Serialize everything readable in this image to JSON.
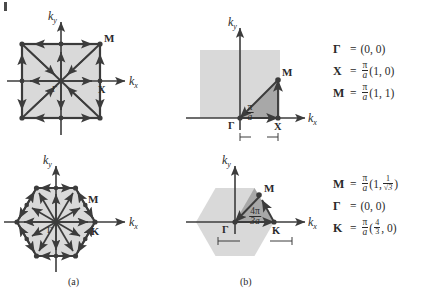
{
  "figure": {
    "panels": [
      {
        "id": "a",
        "label": "(a)"
      },
      {
        "id": "b",
        "label": "(b)"
      }
    ],
    "axis_labels": {
      "kx": "k",
      "kx_sub": "x",
      "ky": "k",
      "ky_sub": "y"
    },
    "colors": {
      "zone_fill": "#d9d9d9",
      "wedge_fill": "#a8a8a8",
      "line": "#3c3c3c",
      "background": "#ffffff",
      "text": "#2a2a2a"
    }
  },
  "square": {
    "points": {
      "gamma": "Γ",
      "x": "X",
      "m": "M"
    },
    "dimension": {
      "num": "π",
      "den": "a"
    },
    "equations": [
      {
        "symbol": "Γ",
        "eq": "=",
        "prefix": "",
        "num": "",
        "den": "",
        "value": "(0, 0)"
      },
      {
        "symbol": "X",
        "eq": "=",
        "num": "π",
        "den": "a",
        "value": "(1, 0)"
      },
      {
        "symbol": "M",
        "eq": "=",
        "num": "π",
        "den": "a",
        "value": "(1, 1)"
      }
    ]
  },
  "hexagon": {
    "points": {
      "gamma": "Γ",
      "k": "K",
      "m": "M"
    },
    "dimension": {
      "num": "4π",
      "den": "3a"
    },
    "equations": [
      {
        "symbol": "M",
        "eq": "=",
        "num": "π",
        "den": "a",
        "open": "(1,",
        "fnum": "1",
        "fden": "√3",
        "close": ")"
      },
      {
        "symbol": "Γ",
        "eq": "=",
        "value": "(0, 0)"
      },
      {
        "symbol": "K",
        "eq": "=",
        "num": "π",
        "den": "a",
        "open": "(",
        "fnum": "4",
        "fden": "3",
        "close": ", 0)"
      }
    ]
  }
}
